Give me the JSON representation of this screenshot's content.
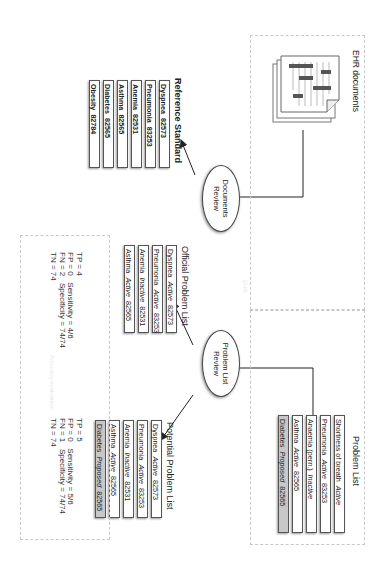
{
  "ehr_box": {
    "label": "EHR documents",
    "icon": "document-stack-icon"
  },
  "problem_list_box": {
    "title": "Problem List",
    "items": [
      {
        "name": "Shortness of breath",
        "status": "Active",
        "code": "",
        "style": "plain"
      },
      {
        "name": "Pneumonia",
        "status": "Active",
        "code": "83253",
        "style": "plain"
      },
      {
        "name": "Anaemia (pern.)",
        "status": "Inactive",
        "code": "",
        "style": "plain"
      },
      {
        "name": "Asthma",
        "status": "Active",
        "code": "82565",
        "style": "plain"
      },
      {
        "name": "Diabetes",
        "status": "Proposed",
        "code": "82565",
        "style": "gray"
      }
    ]
  },
  "documents_review": {
    "line1": "Documents",
    "line2": "Review"
  },
  "problem_list_review": {
    "line1": "Problem List",
    "line2": "Review"
  },
  "reference_standard": {
    "title": "Reference Standard",
    "items": [
      {
        "name": "Dyspnea",
        "code": "82573"
      },
      {
        "name": "Pneumonia",
        "code": "83253"
      },
      {
        "name": "Anemia",
        "code": "82531"
      },
      {
        "name": "Asthma",
        "code": "82565"
      },
      {
        "name": "Diabetes",
        "code": "82565"
      },
      {
        "name": "Obesity",
        "code": "82784"
      }
    ]
  },
  "official_problem_list": {
    "title": "Official Problem List",
    "items": [
      {
        "name": "Dyspnea",
        "status": "Active",
        "code": "82573",
        "style": "plain"
      },
      {
        "name": "Pneumonia",
        "status": "Active",
        "code": "83253",
        "style": "plain"
      },
      {
        "name": "Anemia",
        "status": "Inactive",
        "code": "82531",
        "style": "plain"
      },
      {
        "name": "Asthma",
        "status": "Active",
        "code": "82565",
        "style": "plain"
      }
    ]
  },
  "potential_problem_list": {
    "title": "Potential Problem List",
    "items": [
      {
        "name": "Dyspnea",
        "status": "Active",
        "code": "82573",
        "style": "plain"
      },
      {
        "name": "Pneumonia",
        "status": "Active",
        "code": "83253",
        "style": "plain"
      },
      {
        "name": "Anemia",
        "status": "Inactive",
        "code": "82531",
        "style": "plain"
      },
      {
        "name": "Asthma",
        "status": "Active",
        "code": "82565",
        "style": "plain"
      },
      {
        "name": "Diabetes",
        "status": "Proposed",
        "code": "82565",
        "style": "gray"
      }
    ]
  },
  "stats_official": {
    "tp": "TP = 4",
    "fp": "FP = 0",
    "fn": "FN = 2",
    "tn": "TN = 74",
    "sensitivity": "Sensitivity = 4/6",
    "specificity": "Specificity = 74/74"
  },
  "stats_potential": {
    "tp": "TP = 5",
    "fp": "FP = 0",
    "fn": "FN = 1",
    "tn": "TN = 74",
    "sensitivity": "Sensitivity = 5/6",
    "specificity": "Specificity = 74/74"
  },
  "colors": {
    "line": "#222222",
    "dotted_border": "#c8c8c8",
    "gray_item": "#c8c8c8"
  }
}
